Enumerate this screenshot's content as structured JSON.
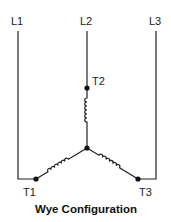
{
  "diagram": {
    "title": "Wye Configuration",
    "lines": [
      {
        "id": "L1",
        "label": "L1"
      },
      {
        "id": "L2",
        "label": "L2"
      },
      {
        "id": "L3",
        "label": "L3"
      }
    ],
    "terminals": [
      {
        "id": "T1",
        "label": "T1"
      },
      {
        "id": "T2",
        "label": "T2"
      },
      {
        "id": "T3",
        "label": "T3"
      }
    ],
    "connections": [
      {
        "from": "L1",
        "to": "T1"
      },
      {
        "from": "L2",
        "to": "T2"
      },
      {
        "from": "L3",
        "to": "T3"
      },
      {
        "from": "T1",
        "to": "center",
        "element": "coil"
      },
      {
        "from": "T2",
        "to": "center",
        "element": "coil"
      },
      {
        "from": "T3",
        "to": "center",
        "element": "coil"
      }
    ],
    "colors": {
      "stroke": "#222222",
      "background": "#ffffff"
    }
  }
}
